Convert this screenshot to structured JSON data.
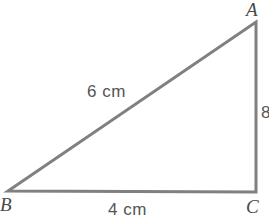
{
  "figure": {
    "background_color": "#ffffff",
    "stroke_color": "#808080",
    "label_color": "#4a4a4a",
    "measure_color": "#555555",
    "stroke_width": 3
  },
  "vertices": [
    {
      "name": "A",
      "label": "A",
      "x": 256,
      "y": 22,
      "label_x": 246,
      "label_y": 0
    },
    {
      "name": "B",
      "label": "B",
      "x": 8,
      "y": 191,
      "label_x": 0,
      "label_y": 195
    },
    {
      "name": "C",
      "label": "C",
      "x": 256,
      "y": 192,
      "label_x": 246,
      "label_y": 197
    }
  ],
  "sides": [
    {
      "name": "hypotenuse",
      "from": "B",
      "to": "A",
      "label": "6 cm",
      "label_x": 87,
      "label_y": 83
    },
    {
      "name": "base",
      "from": "B",
      "to": "C",
      "label": "4 cm",
      "label_x": 108,
      "label_y": 201
    },
    {
      "name": "vertical",
      "from": "A",
      "to": "C",
      "label": "8",
      "label_x": 261,
      "label_y": 104
    }
  ],
  "chart_data": {
    "type": "diagram",
    "points": {
      "A": [
        256,
        22
      ],
      "B": [
        8,
        191
      ],
      "C": [
        256,
        192
      ]
    },
    "edges": [
      {
        "from": "B",
        "to": "A",
        "measure": "6 cm",
        "value": 6,
        "unit": "cm"
      },
      {
        "from": "B",
        "to": "C",
        "measure": "4 cm",
        "value": 4,
        "unit": "cm"
      },
      {
        "from": "A",
        "to": "C",
        "measure": "8",
        "value": 8,
        "unit": ""
      }
    ],
    "annotations": [
      "A",
      "B",
      "C",
      "6 cm",
      "4 cm",
      "8"
    ]
  }
}
